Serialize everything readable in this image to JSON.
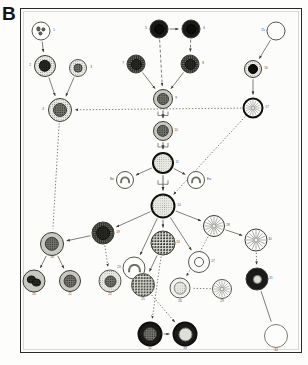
{
  "figure": {
    "panel_letter": "B",
    "background_color": "#fdfdfb",
    "frame_color": "#2a2a2a"
  },
  "cells": [
    {
      "id": "n1",
      "label": "1",
      "x": 41,
      "y": 31,
      "r": 9.5,
      "rim": "rim-thin",
      "cyt": "cyt-white",
      "nucleus": "lobed-multi",
      "nuc_class": "nuc-mid",
      "nuc_r": 2.1,
      "label_dx": 13,
      "label_dy": 0
    },
    {
      "id": "n2",
      "label": "2",
      "x": 45,
      "y": 66,
      "r": 11.0,
      "rim": "rim-med",
      "cyt": "cyt-stipple-light",
      "nucleus": "single",
      "nuc_class": "nuc-dark",
      "nuc_r": 6.2,
      "label_dx": -15,
      "label_dy": 0
    },
    {
      "id": "n3",
      "label": "3",
      "x": 78,
      "y": 68,
      "r": 9.0,
      "rim": "rim-thin",
      "cyt": "cyt-stipple-light",
      "nucleus": "single",
      "nuc_class": "nuc-mid",
      "nuc_r": 4.4,
      "label_dx": 13,
      "label_dy": 0
    },
    {
      "id": "n4",
      "label": "4",
      "x": 60,
      "y": 110,
      "r": 12.0,
      "rim": "rim-med",
      "cyt": "cyt-stipple-light",
      "nucleus": "single",
      "nuc_class": "nuc-mid",
      "nuc_r": 7.0,
      "label_dx": -17,
      "label_dy": 0
    },
    {
      "id": "n5",
      "label": "5",
      "x": 159,
      "y": 29,
      "r": 9.5,
      "rim": "rim-med",
      "cyt": "cyt-verydark",
      "nucleus": "single",
      "nuc_class": "nuc-black",
      "nuc_r": 5.2,
      "label_dx": -13,
      "label_dy": 0
    },
    {
      "id": "n6",
      "label": "6",
      "x": 191,
      "y": 29,
      "r": 9.5,
      "rim": "rim-med",
      "cyt": "cyt-verydark",
      "nucleus": "single",
      "nuc_class": "nuc-black",
      "nuc_r": 5.2,
      "label_dx": 13,
      "label_dy": 0
    },
    {
      "id": "n7",
      "label": "7",
      "x": 136,
      "y": 64,
      "r": 9.5,
      "rim": "rim-med",
      "cyt": "cyt-stipple-dark",
      "nucleus": "single",
      "nuc_class": "nuc-dark",
      "nuc_r": 5.6,
      "label_dx": -13,
      "label_dy": 0
    },
    {
      "id": "n8",
      "label": "8",
      "x": 190,
      "y": 64,
      "r": 9.5,
      "rim": "rim-med",
      "cyt": "cyt-stipple-dark",
      "nucleus": "single",
      "nuc_class": "nuc-dark",
      "nuc_r": 5.6,
      "label_dx": 13,
      "label_dy": 0
    },
    {
      "id": "n9",
      "label": "9",
      "x": 163,
      "y": 99,
      "r": 10.0,
      "rim": "rim-med",
      "cyt": "cyt-stipple-mid",
      "nucleus": "single",
      "nuc_class": "nuc-mid",
      "nuc_r": 6.0,
      "label_dx": 13,
      "label_dy": 0
    },
    {
      "id": "n10",
      "label": "10",
      "x": 163,
      "y": 131,
      "r": 10.0,
      "rim": "rim-med",
      "cyt": "cyt-stipple-mid",
      "nucleus": "single",
      "nuc_class": "nuc-mid",
      "nuc_r": 6.2,
      "label_dx": 13,
      "label_dy": 0
    },
    {
      "id": "n11",
      "label": "11",
      "x": 163,
      "y": 163,
      "r": 11.0,
      "rim": "rim-thick",
      "cyt": "cyt-stipple-light",
      "nucleus": "none",
      "nuc_class": "",
      "nuc_r": 0,
      "label_dx": 14,
      "label_dy": 0
    },
    {
      "id": "n12",
      "label": "Ne",
      "x": 125,
      "y": 180,
      "r": 9.0,
      "rim": "rim-thin",
      "cyt": "cyt-white",
      "nucleus": "horseshoe",
      "nuc_class": "",
      "nuc_r": 0,
      "label_dx": -13,
      "label_dy": 0
    },
    {
      "id": "n13",
      "label": "Eo",
      "x": 196,
      "y": 180,
      "r": 9.0,
      "rim": "rim-thin",
      "cyt": "cyt-white",
      "nucleus": "horseshoe",
      "nuc_class": "",
      "nuc_r": 0,
      "label_dx": 13,
      "label_dy": 0
    },
    {
      "id": "n14",
      "label": "14",
      "x": 163,
      "y": 206,
      "r": 12.5,
      "rim": "rim-thick",
      "cyt": "cyt-stipple-light",
      "nucleus": "none",
      "nuc_class": "",
      "nuc_r": 0,
      "label_dx": 16,
      "label_dy": 0
    },
    {
      "id": "n15",
      "label": "15",
      "x": 276,
      "y": 31,
      "r": 9.5,
      "rim": "rim-thin",
      "cyt": "cyt-white",
      "nucleus": "none",
      "nuc_class": "",
      "nuc_r": 0,
      "label_dx": -13,
      "label_dy": 0
    },
    {
      "id": "n16",
      "label": "16",
      "x": 253,
      "y": 69,
      "r": 9.0,
      "rim": "rim-med",
      "cyt": "cyt-stipple-light",
      "nucleus": "single",
      "nuc_class": "nuc-black",
      "nuc_r": 5.0,
      "label_dx": 13,
      "label_dy": 0
    },
    {
      "id": "n17",
      "label": "17",
      "x": 253,
      "y": 108,
      "r": 10.5,
      "rim": "rim-thick",
      "cyt": "cyt-white",
      "nucleus": "spokes",
      "nuc_class": "",
      "nuc_r": 0,
      "label_dx": 14,
      "label_dy": 0
    },
    {
      "id": "n18",
      "label": "18",
      "x": 52,
      "y": 244,
      "r": 12.0,
      "rim": "rim-med",
      "cyt": "cyt-stipple-mid",
      "nucleus": "single",
      "nuc_class": "nuc-mid",
      "nuc_r": 7.2,
      "label_dx": 0,
      "label_dy": 14
    },
    {
      "id": "n19",
      "label": "19",
      "x": 103,
      "y": 233,
      "r": 11.5,
      "rim": "rim-med",
      "cyt": "cyt-stipple-dark",
      "nucleus": "single",
      "nuc_class": "nuc-dark",
      "nuc_r": 7.4,
      "label_dx": 15,
      "label_dy": 0
    },
    {
      "id": "n20",
      "label": "20",
      "x": 34,
      "y": 281,
      "r": 11.5,
      "rim": "rim-med",
      "cyt": "cyt-stipple-mid",
      "nucleus": "bilobed",
      "nuc_class": "nuc-dark",
      "nuc_r": 4.6,
      "label_dx": 0,
      "label_dy": 14
    },
    {
      "id": "n21",
      "label": "21",
      "x": 70,
      "y": 281,
      "r": 11.0,
      "rim": "rim-med",
      "cyt": "cyt-stipple-mid",
      "nucleus": "single",
      "nuc_class": "nuc-mid",
      "nuc_r": 6.4,
      "label_dx": 0,
      "label_dy": 14
    },
    {
      "id": "n22",
      "label": "22",
      "x": 110,
      "y": 281,
      "r": 11.5,
      "rim": "rim-thin",
      "cyt": "cyt-stipple-light",
      "nucleus": "single",
      "nuc_class": "nuc-mid",
      "nuc_r": 6.0,
      "label_dx": 0,
      "label_dy": 14
    },
    {
      "id": "n23",
      "label": "23",
      "x": 134,
      "y": 268,
      "r": 11.5,
      "rim": "rim-thin",
      "cyt": "cyt-white",
      "nucleus": "horseshoe",
      "nuc_class": "",
      "nuc_r": 0,
      "label_dx": -15,
      "label_dy": 0
    },
    {
      "id": "n24",
      "label": "24",
      "x": 163,
      "y": 243,
      "r": 12.5,
      "rim": "rim-med",
      "cyt": "cyt-granule",
      "nucleus": "none",
      "nuc_class": "",
      "nuc_r": 0,
      "label_dx": 15,
      "label_dy": 0
    },
    {
      "id": "n25",
      "label": "25",
      "x": 143,
      "y": 285,
      "r": 12.0,
      "rim": "rim-thin",
      "cyt": "cyt-granule",
      "nucleus": "none",
      "nuc_class": "",
      "nuc_r": 0,
      "label_dx": 0,
      "label_dy": 15
    },
    {
      "id": "n26",
      "label": "26",
      "x": 180,
      "y": 288,
      "r": 10.5,
      "rim": "rim-thin",
      "cyt": "cyt-pale",
      "nucleus": "stipple-core",
      "nuc_class": "",
      "nuc_r": 0,
      "label_dx": 0,
      "label_dy": 14
    },
    {
      "id": "n27",
      "label": "27",
      "x": 199,
      "y": 262,
      "r": 11.0,
      "rim": "rim-thin",
      "cyt": "cyt-white",
      "nucleus": "ring",
      "nuc_class": "nuc-ring",
      "nuc_r": 5.0,
      "label_dx": 14,
      "label_dy": 0
    },
    {
      "id": "n28",
      "label": "28",
      "x": 214,
      "y": 226,
      "r": 11.0,
      "rim": "rim-med",
      "cyt": "cyt-white",
      "nucleus": "spokes",
      "nuc_class": "",
      "nuc_r": 0,
      "label_dx": 14,
      "label_dy": 0
    },
    {
      "id": "n29",
      "label": "29",
      "x": 222,
      "y": 289,
      "r": 10.0,
      "rim": "rim-thin",
      "cyt": "cyt-white",
      "nucleus": "spokes",
      "nuc_class": "",
      "nuc_r": 0,
      "label_dx": 0,
      "label_dy": 13
    },
    {
      "id": "n30",
      "label": "30",
      "x": 256,
      "y": 240,
      "r": 11.5,
      "rim": "rim-med",
      "cyt": "cyt-white",
      "nucleus": "spokes",
      "nuc_class": "",
      "nuc_r": 0,
      "label_dx": 14,
      "label_dy": 0
    },
    {
      "id": "n31",
      "label": "31",
      "x": 257,
      "y": 279,
      "r": 11.5,
      "rim": "rim-med",
      "cyt": "cyt-verydark",
      "nucleus": "single",
      "nuc_class": "nuc-pale",
      "nuc_r": 4.6,
      "label_dx": 14,
      "label_dy": 0
    },
    {
      "id": "n32",
      "label": "32",
      "x": 150,
      "y": 334,
      "r": 12.5,
      "rim": "rim-thick",
      "cyt": "cyt-verydark",
      "nucleus": "single",
      "nuc_class": "nuc-mid",
      "nuc_r": 7.4,
      "label_dx": 0,
      "label_dy": 15
    },
    {
      "id": "n33",
      "label": "33",
      "x": 185,
      "y": 334,
      "r": 12.5,
      "rim": "rim-thick",
      "cyt": "cyt-verydark",
      "nucleus": "single",
      "nuc_class": "nuc-pale",
      "nuc_r": 7.0,
      "label_dx": 0,
      "label_dy": 15
    },
    {
      "id": "n34",
      "label": "34",
      "x": 276,
      "y": 336,
      "r": 12.0,
      "rim": "rim-hairline",
      "cyt": "cyt-white",
      "nucleus": "none",
      "nuc_class": "",
      "nuc_r": 0,
      "label_dx": 0,
      "label_dy": 15
    }
  ],
  "edges": [
    {
      "from": "n1",
      "to": "n2",
      "style": "solid",
      "arrow": true
    },
    {
      "from": "n2",
      "to": "n4",
      "style": "solid",
      "arrow": true
    },
    {
      "from": "n3",
      "to": "n4",
      "style": "solid",
      "arrow": true
    },
    {
      "from": "n5",
      "to": "n6",
      "style": "solid",
      "arrow": true
    },
    {
      "from": "n5",
      "to": "n9",
      "style": "dashed",
      "arrow": true
    },
    {
      "from": "n6",
      "to": "n8",
      "style": "dashed",
      "arrow": true
    },
    {
      "from": "n7",
      "to": "n9",
      "style": "solid",
      "arrow": true
    },
    {
      "from": "n8",
      "to": "n9",
      "style": "solid",
      "arrow": true
    },
    {
      "from": "n9",
      "to": "n10",
      "style": "bracket",
      "arrow": true
    },
    {
      "from": "n10",
      "to": "n11",
      "style": "bracket",
      "arrow": true
    },
    {
      "from": "n11",
      "to": "n14",
      "style": "bracket",
      "arrow": true
    },
    {
      "from": "n11",
      "to": "n12",
      "style": "solid",
      "arrow": true
    },
    {
      "from": "n11",
      "to": "n13",
      "style": "solid",
      "arrow": true
    },
    {
      "from": "n15",
      "to": "n16",
      "style": "solid",
      "arrow": true
    },
    {
      "from": "n16",
      "to": "n17",
      "style": "solid",
      "arrow": true
    },
    {
      "from": "n17",
      "to": "n4",
      "style": "dotted",
      "arrow": true
    },
    {
      "from": "n17",
      "to": "n14",
      "style": "dotted",
      "arrow": true
    },
    {
      "from": "n4",
      "to": "n18",
      "style": "dotted",
      "arrow": false
    },
    {
      "from": "n14",
      "to": "n19",
      "style": "solid",
      "arrow": true
    },
    {
      "from": "n19",
      "to": "n18",
      "style": "solid",
      "arrow": true
    },
    {
      "from": "n18",
      "to": "n20",
      "style": "solid",
      "arrow": true
    },
    {
      "from": "n18",
      "to": "n21",
      "style": "solid",
      "arrow": true
    },
    {
      "from": "n19",
      "to": "n22",
      "style": "dotted",
      "arrow": true
    },
    {
      "from": "n14",
      "to": "n23",
      "style": "solid",
      "arrow": true
    },
    {
      "from": "n14",
      "to": "n24",
      "style": "solid",
      "arrow": true
    },
    {
      "from": "n14",
      "to": "n27",
      "style": "solid",
      "arrow": true
    },
    {
      "from": "n14",
      "to": "n28",
      "style": "solid",
      "arrow": true
    },
    {
      "from": "n24",
      "to": "n25",
      "style": "solid",
      "arrow": true
    },
    {
      "from": "n24",
      "to": "n32",
      "style": "dotted",
      "arrow": true
    },
    {
      "from": "n25",
      "to": "n33",
      "style": "dotted",
      "arrow": true
    },
    {
      "from": "n32",
      "to": "n33",
      "style": "solid",
      "arrow": true
    },
    {
      "from": "n28",
      "to": "n30",
      "style": "solid",
      "arrow": true
    },
    {
      "from": "n28",
      "to": "n26",
      "style": "dotted",
      "arrow": true
    },
    {
      "from": "n30",
      "to": "n31",
      "style": "dotted",
      "arrow": true
    },
    {
      "from": "n31",
      "to": "n34",
      "style": "solid",
      "arrow": false
    },
    {
      "from": "n29",
      "to": "n26",
      "style": "dotted",
      "arrow": false
    }
  ]
}
